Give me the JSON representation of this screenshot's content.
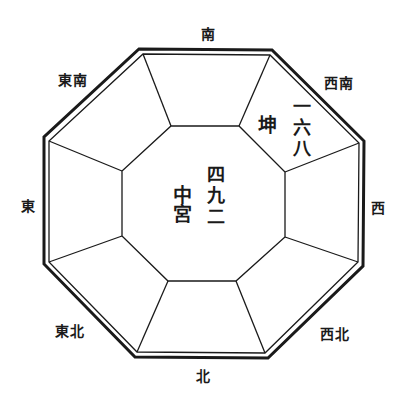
{
  "diagram": {
    "type": "bagua-octagon",
    "colors": {
      "line": "#1a1a1a",
      "background": "#ffffff",
      "text": "#1a1a1a"
    },
    "directions": {
      "south": "南",
      "southwest": "西南",
      "west": "西",
      "northwest": "西北",
      "north": "北",
      "northeast": "東北",
      "east": "東",
      "southeast": "東南"
    },
    "center": {
      "palace": "中宮",
      "numbers": "四九二"
    },
    "southwest_sector": {
      "trigram": "坤",
      "numbers": "一六八"
    }
  }
}
